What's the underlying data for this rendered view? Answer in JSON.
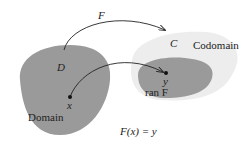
{
  "diagram": {
    "labels": {
      "F_arrow": "F",
      "D": "D",
      "C": "C",
      "codomain": "Codomain",
      "domain": "Domain",
      "x": "x",
      "y": "y",
      "ran_F": "ran F",
      "equation": "F(x) = y"
    },
    "colors": {
      "domain_fill": "#9a9a9a",
      "codomain_fill": "#ededed",
      "range_fill": "#9a9a9a",
      "arrow": "#222222"
    }
  }
}
